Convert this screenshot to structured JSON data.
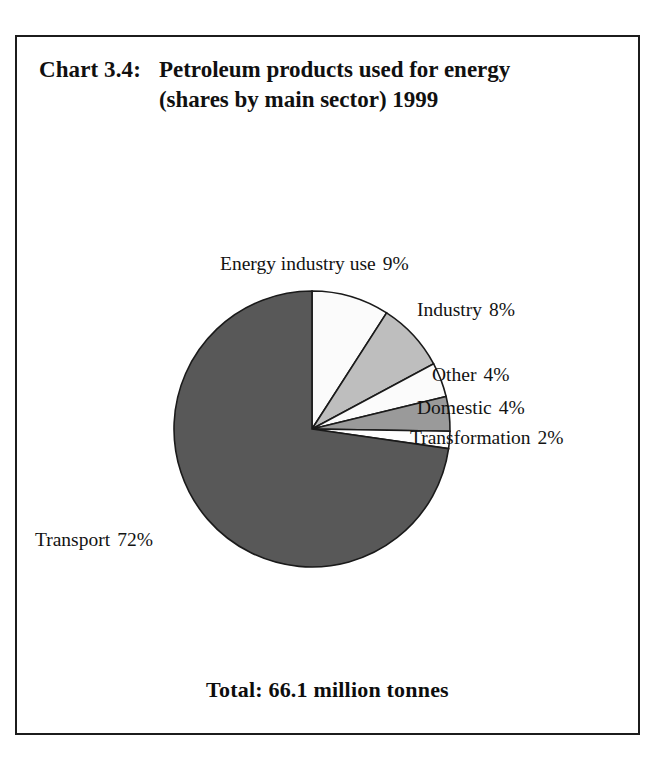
{
  "chart_data": {
    "type": "pie",
    "title": "Petroleum products used for energy (shares by main sector) 1999",
    "chart_number": "Chart 3.4:",
    "title_text": "Petroleum products used for energy (shares by main sector) 1999",
    "categories": [
      "Energy industry use",
      "Industry",
      "Other",
      "Domestic",
      "Transformation",
      "Transport"
    ],
    "values": [
      9,
      8,
      4,
      4,
      2,
      72
    ],
    "value_unit": "%",
    "total_label": "Total: 66.1 million tonnes",
    "total_value": 66.1,
    "total_unit": "million tonnes",
    "xlabel": "",
    "ylabel": "",
    "legend": "none (labels placed around pie)",
    "grid": false,
    "start_angle_deg": 0,
    "direction": "clockwise",
    "slices": [
      {
        "name": "Energy industry use",
        "value": 9,
        "label": "Energy industry use",
        "pct": "9%",
        "color": "#fbfbfb"
      },
      {
        "name": "Industry",
        "value": 8,
        "label": "Industry",
        "pct": "8%",
        "color": "#bebebe"
      },
      {
        "name": "Other",
        "value": 4,
        "label": "Other",
        "pct": "4%",
        "color": "#fbfbfb"
      },
      {
        "name": "Domestic",
        "value": 4,
        "label": "Domestic",
        "pct": "4%",
        "color": "#9a9a9a"
      },
      {
        "name": "Transformation",
        "value": 2,
        "label": "Transformation",
        "pct": "2%",
        "color": "#fdfdfd"
      },
      {
        "name": "Transport",
        "value": 72,
        "label": "Transport",
        "pct": "72%",
        "color": "#585858"
      }
    ]
  },
  "frame": {
    "border_color": "#1c1c1c",
    "background": "#ffffff"
  }
}
